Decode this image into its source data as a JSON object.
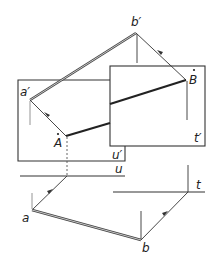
{
  "diagram": {
    "type": "descriptive-geometry projection",
    "labels": {
      "b_prime": "b′",
      "a_prime": "a′",
      "A": "A",
      "B": "B",
      "u_prime": "u′",
      "t_prime": "t′",
      "u": "u",
      "t": "t",
      "a": "a",
      "b": "b"
    },
    "points": {
      "b_prime": [
        136,
        33
      ],
      "a_prime": [
        30,
        100
      ],
      "A": [
        66,
        136
      ],
      "B": [
        186,
        80
      ],
      "a": [
        32,
        210
      ],
      "b": [
        141,
        240
      ]
    },
    "planes": {
      "u_prime_plane": {
        "x1": 18,
        "y1": 80,
        "x2": 125,
        "y2": 161
      },
      "t_prime_plane": {
        "x1": 110,
        "y1": 66,
        "x2": 205,
        "y2": 146
      }
    },
    "traces": {
      "u_line": {
        "x1": 20,
        "y": 176,
        "x2": 125
      },
      "t_line": {
        "x1": 113,
        "y": 192,
        "x2": 205
      }
    },
    "colors": {
      "ink": "#222222",
      "background": "#ffffff"
    }
  }
}
